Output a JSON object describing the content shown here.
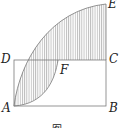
{
  "figure": {
    "labels": {
      "A": "A",
      "B": "B",
      "C": "C",
      "D": "D",
      "E": "E",
      "F": "F"
    },
    "caption": "图",
    "colors": {
      "stroke": "#7a7a7a",
      "hatch": "#9a9a9a",
      "label": "#222222"
    }
  }
}
